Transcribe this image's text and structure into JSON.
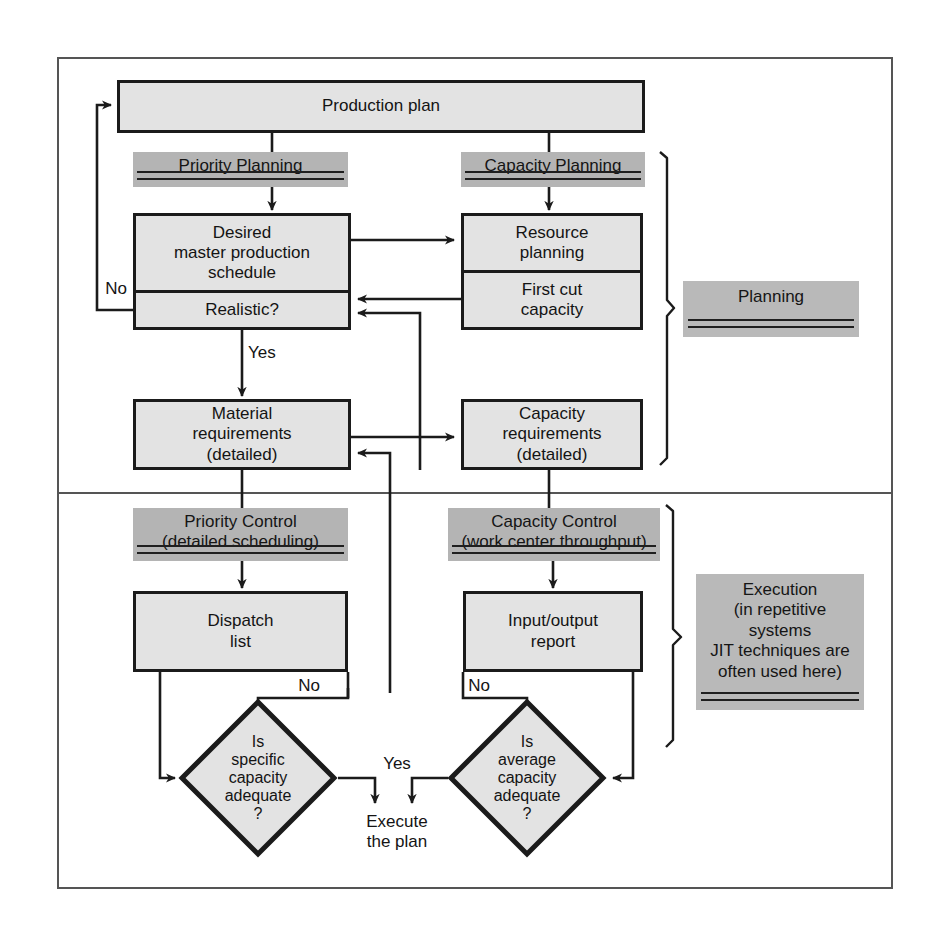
{
  "figure": {
    "colors": {
      "node_fill": "#e3e3e3",
      "band_fill": "#b4b4b4",
      "side_fill": "#b9b9b9",
      "line": "#1b1b1b",
      "frame": "#555555"
    }
  },
  "nodes": {
    "production_plan": "Production plan",
    "desired_mps": "Desired\nmaster production\nschedule",
    "realistic": "Realistic?",
    "resource_planning": "Resource\nplanning",
    "first_cut_capacity": "First cut\ncapacity",
    "material_requirements": "Material\nrequirements\n(detailed)",
    "capacity_requirements": "Capacity\nrequirements\n(detailed)",
    "dispatch_list": "Dispatch\nlist",
    "input_output_report": "Input/output\nreport",
    "diamond_specific": "Is\nspecific\ncapacity\nadequate\n?",
    "diamond_average": "Is\naverage\ncapacity\nadequate\n?"
  },
  "bands": {
    "priority_planning": "Priority Planning",
    "capacity_planning": "Capacity Planning",
    "priority_control": "Priority Control\n(detailed scheduling)",
    "capacity_control": "Capacity Control\n(work center throughput)"
  },
  "side_labels": {
    "planning": "Planning",
    "execution": "Execution\n(in repetitive\nsystems\nJIT techniques are\noften used here)"
  },
  "edge_labels": {
    "no_mps": "No",
    "yes_mps": "Yes",
    "no_dispatch": "No",
    "no_input_output": "No",
    "yes_execute": "Yes",
    "execute_the_plan": "Execute\nthe plan"
  }
}
